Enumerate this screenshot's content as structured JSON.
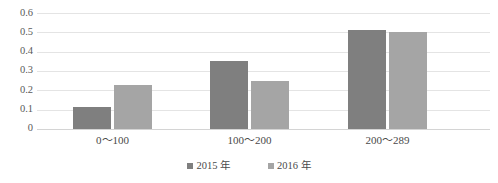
{
  "chart_data": {
    "type": "bar",
    "title": "",
    "xlabel": "",
    "ylabel": "",
    "categories": [
      "0～100",
      "100～200",
      "200～289"
    ],
    "series": [
      {
        "name": "2015 年",
        "color": "#7f7f7f",
        "values": [
          0.115,
          0.35,
          0.51
        ]
      },
      {
        "name": "2016 年",
        "color": "#a5a5a5",
        "values": [
          0.23,
          0.248,
          0.5
        ]
      }
    ],
    "ylim": [
      0,
      0.6
    ],
    "yticks": [
      "0.6",
      "0.5",
      "0.4",
      "0.3",
      "0.2",
      "0.1",
      "0"
    ],
    "ytick_values": [
      0.6,
      0.5,
      0.4,
      0.3,
      0.2,
      0.1,
      0
    ],
    "grid": "horizontal",
    "legend_position": "bottom"
  },
  "axis": {
    "y_tick_0": "0.6",
    "y_tick_1": "0.5",
    "y_tick_2": "0.4",
    "y_tick_3": "0.3",
    "y_tick_4": "0.2",
    "y_tick_5": "0.1",
    "y_tick_6": "0"
  },
  "categories": {
    "c0": "0～100",
    "c1": "100～200",
    "c2": "200～289"
  },
  "legend": {
    "item_0": "2015 年",
    "item_1": "2016 年"
  },
  "title_remnant": "——  ———"
}
